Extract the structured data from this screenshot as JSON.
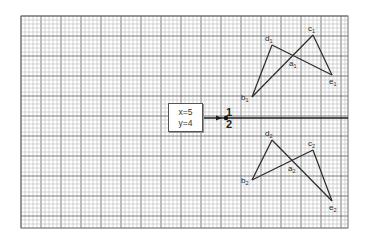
{
  "diagram": {
    "grid": {
      "left": 21,
      "top": 16,
      "right": 348,
      "bottom": 228,
      "minor_step": 4,
      "major_every": 5,
      "minor_color": "#b9b9b9",
      "major_color": "#6f6f6f"
    },
    "axis": {
      "y": 118,
      "x_start": 201,
      "x_end": 348,
      "arrow_tip_x": 222,
      "dot_x": 226,
      "label_above": "1",
      "label_below": "2",
      "label_x": 229
    },
    "info_box": {
      "line1": "x=5",
      "line2": "y=4",
      "left": 168,
      "top": 103,
      "width": 33,
      "height": 27
    },
    "figure_upper": {
      "points": {
        "a": {
          "x": 293,
          "y": 56,
          "label": "a",
          "sub": "1"
        },
        "b": {
          "x": 252,
          "y": 97,
          "label": "b",
          "sub": "1"
        },
        "c": {
          "x": 313,
          "y": 35,
          "label": "c",
          "sub": "1"
        },
        "d": {
          "x": 272,
          "y": 45,
          "label": "d",
          "sub": "1"
        },
        "e": {
          "x": 332,
          "y": 75,
          "label": "e",
          "sub": "1"
        }
      },
      "segments": [
        [
          "b",
          "d"
        ],
        [
          "d",
          "e"
        ],
        [
          "b",
          "c"
        ],
        [
          "c",
          "e"
        ]
      ]
    },
    "figure_lower": {
      "points": {
        "a": {
          "x": 292,
          "y": 161,
          "label": "a",
          "sub": "2"
        },
        "b": {
          "x": 252,
          "y": 180,
          "label": "b",
          "sub": "2"
        },
        "c": {
          "x": 313,
          "y": 150,
          "label": "c",
          "sub": "2"
        },
        "d": {
          "x": 272,
          "y": 140,
          "label": "d",
          "sub": "2"
        },
        "e": {
          "x": 332,
          "y": 201,
          "label": "e",
          "sub": "2"
        }
      },
      "segments": [
        [
          "b",
          "d"
        ],
        [
          "d",
          "e"
        ],
        [
          "b",
          "c"
        ],
        [
          "c",
          "e"
        ]
      ]
    }
  }
}
